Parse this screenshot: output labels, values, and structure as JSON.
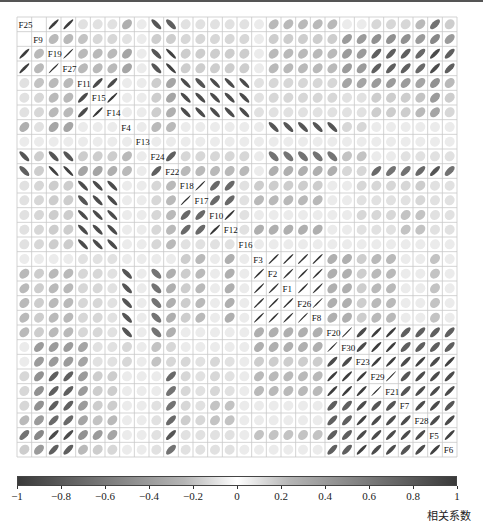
{
  "chart_data": {
    "type": "heatmap",
    "subtype": "correlation-ellipse-matrix",
    "title": "",
    "variables": [
      "F25",
      "F9",
      "F19",
      "F27",
      "F11",
      "F15",
      "F14",
      "F4",
      "F13",
      "F24",
      "F22",
      "F18",
      "F17",
      "F10",
      "F12",
      "F16",
      "F3",
      "F2",
      "F1",
      "F26",
      "F8",
      "F20",
      "F30",
      "F23",
      "F29",
      "F21",
      "F7",
      "F28",
      "F5",
      "F6"
    ],
    "upper_triangle_rows": [
      [
        0.0,
        0.92,
        0.92,
        0.1,
        0.1,
        0.1,
        0.35,
        0.05,
        -0.8,
        -0.75,
        0.1,
        0.1,
        0.1,
        0.1,
        0.1,
        0.05,
        0.3,
        0.3,
        0.3,
        0.3,
        0.3,
        0.05,
        0.05,
        0.15,
        0.15,
        0.15,
        0.3,
        0.65,
        0.2,
        0.25
      ],
      [
        0.3,
        0.3,
        0.25,
        0.15,
        0.15,
        0.1,
        0.05,
        0.2,
        0.2,
        0.15,
        0.15,
        0.15,
        0.15,
        0.15,
        0.05,
        0.2,
        0.2,
        0.2,
        0.2,
        0.2,
        0.45,
        0.45,
        0.5,
        0.5,
        0.5,
        0.45,
        0.55,
        0.45,
        0.4
      ],
      [
        0.98,
        0.3,
        0.3,
        0.3,
        0.4,
        0.05,
        -0.8,
        -0.9,
        0.2,
        0.2,
        0.2,
        0.2,
        0.2,
        0.05,
        0.3,
        0.3,
        0.3,
        0.3,
        0.3,
        0.45,
        0.45,
        0.75,
        0.75,
        0.75,
        0.7,
        0.85,
        0.75,
        0.75
      ],
      [
        0.3,
        0.3,
        0.3,
        0.4,
        0.05,
        -0.8,
        -0.9,
        0.2,
        0.2,
        0.2,
        0.2,
        0.2,
        0.05,
        0.3,
        0.3,
        0.3,
        0.3,
        0.3,
        0.45,
        0.45,
        0.75,
        0.75,
        0.75,
        0.7,
        0.85,
        0.75,
        0.75
      ],
      [
        0.85,
        0.85,
        0.05,
        0.05,
        0.2,
        0.4,
        -0.85,
        -0.8,
        -0.85,
        -0.85,
        -0.85,
        0.1,
        0.15,
        0.15,
        0.15,
        0.15,
        0.15,
        0.4,
        0.4,
        0.45,
        0.45,
        0.45,
        0.4,
        0.5,
        0.3,
        0.3
      ],
      [
        0.95,
        0.05,
        0.05,
        0.2,
        0.4,
        -0.85,
        -0.85,
        -0.85,
        -0.85,
        -0.85,
        0.1,
        0.15,
        0.15,
        0.15,
        0.15,
        0.15,
        0.1,
        0.1,
        0.2,
        0.2,
        0.2,
        0.25,
        0.45,
        0.2,
        0.2
      ],
      [
        0.05,
        0.05,
        0.2,
        0.35,
        -0.85,
        -0.85,
        -0.85,
        -0.85,
        -0.85,
        0.1,
        0.1,
        0.1,
        0.1,
        0.1,
        0.1,
        0.1,
        0.1,
        0.2,
        0.2,
        0.2,
        0.3,
        0.4,
        0.15,
        0.15
      ],
      [
        0.05,
        0.3,
        0.3,
        0.05,
        0.05,
        0.05,
        0.05,
        0.05,
        0.05,
        -0.8,
        -0.8,
        -0.8,
        -0.8,
        -0.8,
        0.15,
        0.15,
        0.05,
        0.05,
        0.05,
        0.05,
        0.05,
        0.05,
        0.05,
        0.05
      ],
      [
        0.05,
        0.05,
        0.05,
        0.05,
        0.05,
        0.05,
        0.05,
        0.05,
        0.05,
        0.05,
        0.05,
        0.05,
        0.05,
        0.05,
        0.05,
        0.05,
        0.05,
        0.05,
        0.05,
        0.05,
        0.05,
        0.05
      ],
      [
        0.75,
        0.15,
        0.15,
        0.15,
        0.15,
        0.15,
        0.05,
        -0.65,
        -0.65,
        -0.65,
        -0.65,
        -0.65,
        0.25,
        0.25,
        0.05,
        0.05,
        0.1,
        0.1,
        0.1,
        0.1,
        0.15,
        0.15
      ],
      [
        0.3,
        0.3,
        0.3,
        0.3,
        0.3,
        0.05,
        0.35,
        0.35,
        0.35,
        0.35,
        0.35,
        0.15,
        0.15,
        0.7,
        0.65,
        0.65,
        0.7,
        0.8,
        0.65,
        0.7
      ],
      [
        0.98,
        0.7,
        0.7,
        0.1,
        0.2,
        0.2,
        0.2,
        0.2,
        0.2,
        0.05,
        0.05,
        0.15,
        0.15,
        0.15,
        0.15,
        0.2,
        0.1,
        0.1
      ],
      [
        0.7,
        0.7,
        0.1,
        0.3,
        0.3,
        0.3,
        0.3,
        0.3,
        0.05,
        0.05,
        0.1,
        0.1,
        0.1,
        0.1,
        0.15,
        0.1,
        0.1
      ],
      [
        0.95,
        0.1,
        0.05,
        0.05,
        0.05,
        0.05,
        0.05,
        0.05,
        0.05,
        0.15,
        0.15,
        0.15,
        0.25,
        0.25,
        0.1,
        0.1
      ],
      [
        0.1,
        0.35,
        0.35,
        0.35,
        0.35,
        0.35,
        0.05,
        0.05,
        0.1,
        0.1,
        0.1,
        0.25,
        0.25,
        0.1,
        0.1
      ],
      [
        0.05,
        0.05,
        0.05,
        0.05,
        0.05,
        0.05,
        0.05,
        0.05,
        0.05,
        0.05,
        0.05,
        0.05,
        0.05,
        0.05
      ],
      [
        0.97,
        0.97,
        0.97,
        0.97,
        0.35,
        0.35,
        0.2,
        0.3,
        0.3,
        0.05,
        0.05,
        0.25,
        0.05
      ],
      [
        0.97,
        0.97,
        0.97,
        0.35,
        0.35,
        0.2,
        0.3,
        0.3,
        0.05,
        0.05,
        0.25,
        0.05
      ],
      [
        0.97,
        0.97,
        0.35,
        0.35,
        0.2,
        0.3,
        0.3,
        0.05,
        0.05,
        0.25,
        0.05
      ],
      [
        0.99,
        0.35,
        0.35,
        0.2,
        0.3,
        0.3,
        0.05,
        0.05,
        0.25,
        0.05
      ],
      [
        0.35,
        0.35,
        0.2,
        0.3,
        0.3,
        0.05,
        0.05,
        0.25,
        0.05
      ],
      [
        0.99,
        0.85,
        0.92,
        0.92,
        0.75,
        0.75,
        0.75,
        0.75
      ],
      [
        0.85,
        0.92,
        0.92,
        0.75,
        0.75,
        0.75,
        0.75
      ],
      [
        0.92,
        0.92,
        0.85,
        0.9,
        0.85,
        0.9
      ],
      [
        0.99,
        0.8,
        0.85,
        0.85,
        0.85
      ],
      [
        0.8,
        0.85,
        0.85,
        0.85
      ],
      [
        0.85,
        0.85,
        0.8
      ],
      [
        0.85,
        0.85
      ],
      [
        0.9
      ],
      []
    ],
    "colorbar": {
      "min": -1,
      "max": 1,
      "ticks": [
        -1,
        -0.8,
        -0.6,
        -0.4,
        -0.2,
        0,
        0.2,
        0.4,
        0.6,
        0.8,
        1
      ],
      "tick_labels": [
        "−1",
        "−0.8",
        "−0.6",
        "−0.4",
        "−0.2",
        "0",
        "0.2",
        "0.4",
        "0.6",
        "0.8",
        "1"
      ],
      "label": "相关系数",
      "orientation": "horizontal",
      "position": "bottom"
    },
    "colors": {
      "strong": "#333333",
      "zero": "#ffffff",
      "grid": "#c8c8c8"
    },
    "grid": true,
    "legend_position": "bottom"
  }
}
